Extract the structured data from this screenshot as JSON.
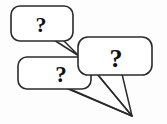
{
  "illustration": {
    "title": "three overlapping speech bubbles with question marks",
    "background_color": "#fdfdfd",
    "line_color": "#2b2b2b",
    "glyph_color": "#111111",
    "bubble_fill": "#ffffff",
    "style": "black-and-white line drawing",
    "bubble_count": 3,
    "tail_convergence_point": "132,116"
  },
  "bubbles": [
    {
      "id": "bubble-top-left",
      "position": "top-left",
      "glyph": "?",
      "glyph_name": "question-mark",
      "tail_direction": "down-right"
    },
    {
      "id": "bubble-right",
      "position": "middle-right",
      "glyph": "?",
      "glyph_name": "question-mark",
      "tail_direction": "down-left"
    },
    {
      "id": "bubble-bottom-left",
      "position": "bottom-left",
      "glyph": "?",
      "glyph_name": "question-mark",
      "tail_direction": "right-down"
    }
  ]
}
